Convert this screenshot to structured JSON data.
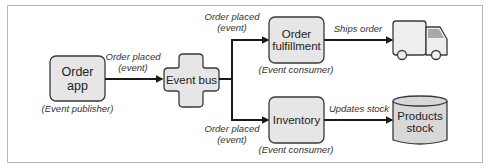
{
  "diagram": {
    "nodes": {
      "order_app": {
        "label_line1": "Order",
        "label_line2": "app",
        "role": "(Event publisher)"
      },
      "event_bus": {
        "label": "Event bus"
      },
      "order_fulfillment": {
        "label_line1": "Order",
        "label_line2": "fulfillment",
        "role": "(Event consumer)"
      },
      "inventory": {
        "label": "Inventory",
        "role": "(Event consumer)"
      },
      "truck": {
        "icon": "truck-icon"
      },
      "products_stock": {
        "label_line1": "Products",
        "label_line2": "stock",
        "icon": "database-cylinder-icon"
      }
    },
    "edges": {
      "app_to_bus": {
        "line1": "Order placed",
        "line2": "(event)"
      },
      "bus_to_fulfillment": {
        "line1": "Order placed",
        "line2": "(event)"
      },
      "bus_to_inventory": {
        "line1": "Order placed",
        "line2": "(event)"
      },
      "fulfillment_to_truck": {
        "label": "Ships order"
      },
      "inventory_to_stock": {
        "label": "Updates stock"
      }
    },
    "colors": {
      "box_fill": "#e6e6e6",
      "box_stroke": "#3a3a3a",
      "truck_window": "#a9a9a9",
      "line": "#1a1a1a",
      "frame": "#b8b8b8"
    }
  }
}
